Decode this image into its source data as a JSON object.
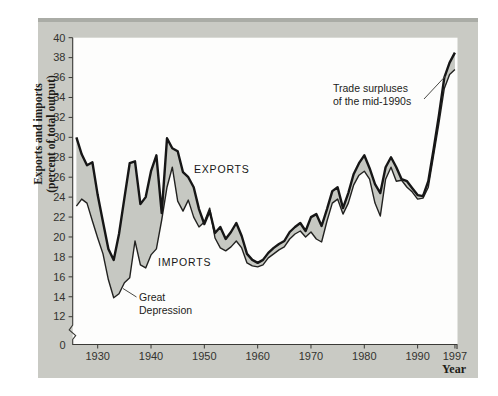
{
  "figure": {
    "y_axis_title_line1": "Exports and imports",
    "y_axis_title_line2": "(percent of total output)",
    "x_axis_title": "Year",
    "series_labels": {
      "exports": "EXPORTS",
      "imports": "IMPORTS"
    },
    "annotations": {
      "great_depression": [
        "Great",
        "Depression"
      ],
      "trade_surpluses": [
        "Trade surpluses",
        "of the mid-1990s"
      ]
    },
    "zero_label": "0"
  },
  "chart_data": {
    "type": "area",
    "title": "",
    "xlabel": "Year",
    "ylabel": "Exports and imports (percent of total output)",
    "xlim": [
      1925.3,
      1997
    ],
    "ylim": [
      0,
      40
    ],
    "y_axis_break": [
      0,
      12
    ],
    "grid": false,
    "legend_position": "inline-labels",
    "x_ticks": [
      1930,
      1940,
      1950,
      1960,
      1970,
      1980,
      1990,
      1997
    ],
    "y_ticks": [
      40,
      38,
      36,
      34,
      32,
      30,
      28,
      26,
      24,
      22,
      20,
      18,
      16,
      14,
      12
    ],
    "x": [
      1926,
      1927,
      1928,
      1929,
      1930,
      1931,
      1932,
      1933,
      1934,
      1935,
      1936,
      1937,
      1938,
      1939,
      1940,
      1941,
      1942,
      1943,
      1944,
      1945,
      1946,
      1947,
      1948,
      1949,
      1950,
      1951,
      1952,
      1953,
      1954,
      1955,
      1956,
      1957,
      1958,
      1959,
      1960,
      1961,
      1962,
      1963,
      1964,
      1965,
      1966,
      1967,
      1968,
      1969,
      1970,
      1971,
      1972,
      1973,
      1974,
      1975,
      1976,
      1977,
      1978,
      1979,
      1980,
      1981,
      1982,
      1983,
      1984,
      1985,
      1986,
      1987,
      1988,
      1989,
      1990,
      1991,
      1992,
      1993,
      1994,
      1995,
      1996,
      1997
    ],
    "series": [
      {
        "name": "Exports",
        "values": [
          30.0,
          28.3,
          27.2,
          27.5,
          24.2,
          21.5,
          18.8,
          17.7,
          20.3,
          23.9,
          27.4,
          27.6,
          23.3,
          24.0,
          26.6,
          28.2,
          22.4,
          29.9,
          28.9,
          28.6,
          26.5,
          26.0,
          25.0,
          22.8,
          21.3,
          22.6,
          20.4,
          21.0,
          19.8,
          20.5,
          21.4,
          20.1,
          18.3,
          17.7,
          17.4,
          17.7,
          18.4,
          18.9,
          19.3,
          19.6,
          20.5,
          21.0,
          21.4,
          20.6,
          22.0,
          22.3,
          21.1,
          22.8,
          24.6,
          25.0,
          22.9,
          24.4,
          26.3,
          27.4,
          28.2,
          26.9,
          25.3,
          24.4,
          27.0,
          28.0,
          27.0,
          25.8,
          25.6,
          24.9,
          24.2,
          24.1,
          25.6,
          28.8,
          32.2,
          36.0,
          37.5,
          38.5
        ]
      },
      {
        "name": "Imports",
        "values": [
          23.1,
          23.8,
          23.4,
          21.6,
          19.9,
          18.3,
          15.7,
          13.9,
          14.3,
          15.4,
          15.9,
          19.6,
          17.2,
          16.9,
          18.2,
          18.8,
          21.7,
          25.0,
          27.0,
          23.6,
          22.6,
          23.7,
          22.0,
          21.0,
          21.5,
          22.9,
          19.9,
          18.9,
          18.6,
          19.0,
          19.6,
          18.9,
          17.4,
          17.1,
          17.0,
          17.2,
          17.9,
          18.3,
          18.7,
          19.0,
          19.8,
          20.3,
          20.6,
          20.0,
          20.5,
          19.8,
          19.5,
          21.6,
          23.4,
          23.8,
          22.3,
          23.4,
          25.2,
          26.2,
          26.6,
          25.8,
          23.4,
          22.1,
          25.8,
          27.0,
          25.6,
          25.7,
          25.0,
          24.5,
          23.8,
          23.9,
          25.0,
          28.2,
          31.4,
          34.9,
          36.3,
          36.8
        ]
      }
    ],
    "colors": {
      "line": "#161616",
      "area_fill": "#c6c8c2",
      "box_bg": "#c9cac4",
      "box_top_edge": "#aaaca6",
      "plot_bg": "#fdfdfc",
      "tick_text": "#33332f",
      "title_text": "#201c18"
    }
  }
}
